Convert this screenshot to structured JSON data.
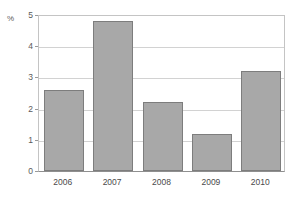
{
  "caption": {
    "clipped_text": "",
    "note": ""
  },
  "chart_data": {
    "type": "bar",
    "title": "",
    "xlabel": "",
    "ylabel": "%",
    "categories": [
      "2006",
      "2007",
      "2008",
      "2009",
      "2010"
    ],
    "values": [
      2.6,
      4.8,
      2.2,
      1.2,
      3.2
    ],
    "ylim": [
      0,
      5
    ],
    "yticks": [
      "0",
      "1",
      "2",
      "3",
      "4",
      "5"
    ],
    "ytick_values": [
      0,
      1,
      2,
      3,
      4,
      5
    ],
    "grid": true,
    "legend": "none",
    "colors": {
      "bar_fill": "#a8a8a8",
      "bar_border": "#7d7d7d",
      "gridline": "#d2d2d2",
      "axis": "#8f8f8f",
      "background": "#ffffff",
      "text": "#4a4a4a"
    }
  }
}
